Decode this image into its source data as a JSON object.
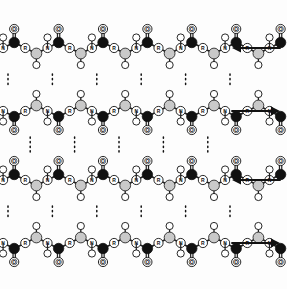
{
  "figure": {
    "background_color": "#fdfdfd",
    "width": 287,
    "height": 289
  },
  "atom_colors": {
    "carbonyl_carbon": "#111111",
    "alpha_carbon": "#c9c9c9",
    "open_circle_fill": "#ffffff",
    "stroke": "#111111",
    "bond": "#222222",
    "hbond": "#111111"
  },
  "atom_labels": {
    "oxygen": "O",
    "nitrogen": "N",
    "hydrogen": "H",
    "sidechain": "R"
  },
  "legend_notes": {
    "black_circle": "carbonyl carbon",
    "gray_circle": "alpha carbon",
    "open_circle_O": "oxygen",
    "open_circle_N": "nitrogen",
    "open_circle_H": "hydrogen",
    "open_circle_R": "side chain"
  },
  "chains": [
    {
      "id": "chain-1",
      "direction": "left",
      "arrow_glyph": "←",
      "y": 48,
      "label": ""
    },
    {
      "id": "chain-2",
      "direction": "right",
      "arrow_glyph": "→",
      "y": 111,
      "label": ""
    },
    {
      "id": "chain-3",
      "direction": "left",
      "arrow_glyph": "←",
      "y": 180,
      "label": ""
    },
    {
      "id": "chain-4",
      "direction": "right",
      "arrow_glyph": "→",
      "y": 243,
      "label": ""
    }
  ],
  "hydrogen_bonds": {
    "style": "dotted",
    "count_per_gap": 5,
    "description": "N-H...O=C hydrogen bonds between adjacent antiparallel strands"
  }
}
